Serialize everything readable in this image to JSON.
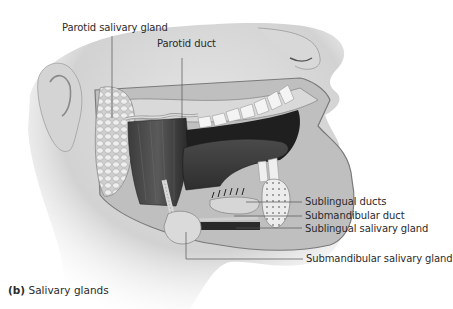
{
  "figure": {
    "caption_tag": "(b)",
    "caption_text": " Salivary glands",
    "color_scheme": "grayscale"
  },
  "labels": {
    "parotid_salivary_gland": "Parotid salivary gland",
    "parotid_duct": "Parotid duct",
    "sublingual_ducts": "Sublingual ducts",
    "submandibular_duct": "Submandibular duct",
    "sublingual_salivary_gland": "Sublingual salivary gland",
    "submandibular_salivary_gland": "Submandibular salivary gland"
  }
}
